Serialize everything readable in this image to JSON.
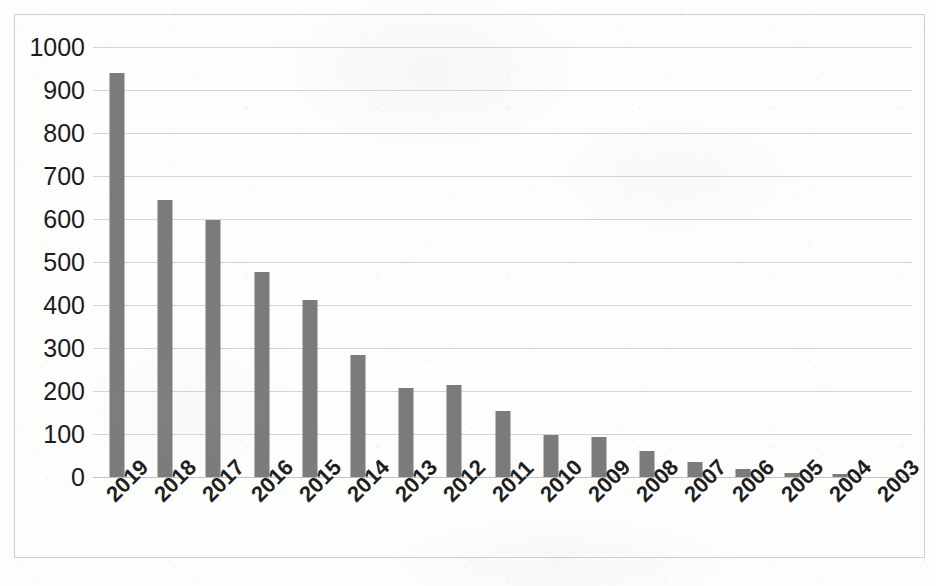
{
  "chart_data": {
    "type": "bar",
    "title": "",
    "subtitle": "",
    "xlabel": "",
    "ylabel": "",
    "categories": [
      "2019",
      "2018",
      "2017",
      "2016",
      "2015",
      "2014",
      "2013",
      "2012",
      "2011",
      "2010",
      "2009",
      "2008",
      "2007",
      "2006",
      "2005",
      "2004",
      "2003"
    ],
    "values": [
      940,
      645,
      598,
      477,
      412,
      284,
      208,
      213,
      153,
      98,
      93,
      60,
      34,
      19,
      9,
      7,
      0
    ],
    "series": [
      {
        "name": "Count by year",
        "values": [
          940,
          645,
          598,
          477,
          412,
          284,
          208,
          213,
          153,
          98,
          93,
          60,
          34,
          19,
          9,
          7,
          0
        ]
      }
    ],
    "ylim": [
      0,
      1000
    ],
    "ytick_step": 100,
    "yticks": [
      0,
      100,
      200,
      300,
      400,
      500,
      600,
      700,
      800,
      900,
      1000
    ],
    "ytick_labels": [
      "0",
      "100",
      "200",
      "300",
      "400",
      "500",
      "600",
      "700",
      "800",
      "900",
      "1000"
    ],
    "grid": true,
    "grid_axis": "y",
    "legend": false,
    "legend_position": "none",
    "xtick_rotation": -45,
    "bar_color": "#7b7b7b",
    "gridline_color": "#d4d4d4",
    "axis_color": "#c2c2c2",
    "plot_background": "#fdfdfc",
    "border_color": "#cfcfcf"
  }
}
